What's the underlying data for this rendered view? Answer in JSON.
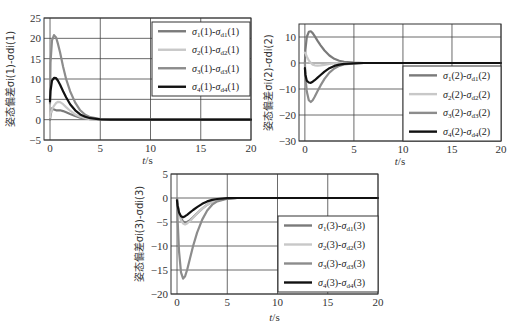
{
  "colors": {
    "s1": "#7a7a7a",
    "s2": "#c8c8c8",
    "s3": "#8c8c8c",
    "s4": "#111111",
    "grid": "#444444",
    "frame": "#333333"
  },
  "chart_data": [
    {
      "type": "line",
      "title": "",
      "xlabel": "t/s",
      "ylabel": "姿态偏差σi(1)-σdi(1)",
      "xlim": [
        -0.6,
        20
      ],
      "ylim": [
        -5,
        25
      ],
      "xticks": [
        0,
        5,
        10,
        15,
        20
      ],
      "yticks": [
        -5,
        0,
        5,
        10,
        15,
        20,
        25
      ],
      "grid": true,
      "legend_position": "upper right",
      "x": [
        0,
        0.05,
        0.2,
        0.4,
        0.6,
        0.8,
        1.0,
        1.3,
        1.6,
        2.0,
        2.5,
        3.0,
        3.5,
        4.0,
        5.0,
        6.0,
        8.0,
        20.0
      ],
      "series": [
        {
          "name": "σ1(1)-σd1(1)",
          "key": "s1",
          "values": [
            0,
            1,
            2.8,
            2.5,
            2.3,
            2.3,
            2.3,
            2.1,
            1.8,
            1.4,
            0.9,
            0.5,
            0.3,
            0.15,
            0.05,
            0,
            0,
            0
          ]
        },
        {
          "name": "σ2(1)-σd2(1)",
          "key": "s2",
          "values": [
            0.5,
            1.5,
            2.5,
            3.4,
            4.1,
            4.4,
            4.3,
            3.8,
            3.1,
            2.2,
            1.3,
            0.7,
            0.35,
            0.15,
            0.05,
            0,
            0,
            0
          ]
        },
        {
          "name": "σ3(1)-σd3(1)",
          "key": "s3",
          "values": [
            4,
            14,
            19.5,
            20.8,
            20.2,
            18.5,
            16.5,
            13,
            10,
            7,
            4.2,
            2.3,
            1.2,
            0.6,
            0.15,
            0.05,
            0,
            0
          ]
        },
        {
          "name": "σ4(1)-σd4(1)",
          "key": "s4",
          "values": [
            4.5,
            7,
            9.6,
            10.3,
            10.2,
            9.5,
            8.6,
            7.0,
            5.5,
            3.8,
            2.3,
            1.3,
            0.7,
            0.35,
            0.1,
            0,
            0,
            0
          ]
        }
      ]
    },
    {
      "type": "line",
      "title": "",
      "xlabel": "t/s",
      "ylabel": "姿态偏差σi(2)-σdi(2)",
      "xlim": [
        -0.6,
        20
      ],
      "ylim": [
        -30,
        15
      ],
      "xticks": [
        0,
        5,
        10,
        15,
        20
      ],
      "yticks": [
        -30,
        -20,
        -10,
        0,
        10
      ],
      "grid": true,
      "legend_position": "lower right",
      "x": [
        0,
        0.05,
        0.2,
        0.4,
        0.6,
        0.8,
        1.0,
        1.3,
        1.6,
        2.0,
        2.5,
        3.0,
        3.5,
        4.0,
        5.0,
        6.0,
        8.0,
        20.0
      ],
      "series": [
        {
          "name": "σ1(2)-σd1(2)",
          "key": "s1",
          "values": [
            0,
            5,
            10,
            12,
            12.2,
            11.5,
            10.3,
            8.5,
            6.8,
            4.8,
            2.9,
            1.6,
            0.9,
            0.45,
            0.1,
            0,
            0,
            0
          ]
        },
        {
          "name": "σ2(2)-σd2(2)",
          "key": "s2",
          "values": [
            4,
            3.8,
            2.5,
            1.0,
            0,
            -0.6,
            -0.9,
            -1.0,
            -0.9,
            -0.7,
            -0.4,
            -0.2,
            -0.1,
            0,
            0,
            0,
            0,
            0
          ]
        },
        {
          "name": "σ3(2)-σd3(2)",
          "key": "s3",
          "values": [
            0,
            -5,
            -11,
            -14.3,
            -15,
            -14.3,
            -13,
            -10.8,
            -8.6,
            -6.1,
            -3.7,
            -2.1,
            -1.1,
            -0.55,
            -0.15,
            0,
            0,
            0
          ]
        },
        {
          "name": "σ4(2)-σd4(2)",
          "key": "s4",
          "values": [
            -2,
            -4.5,
            -6.8,
            -7.5,
            -7.6,
            -7.2,
            -6.6,
            -5.6,
            -4.6,
            -3.3,
            -2.0,
            -1.1,
            -0.6,
            -0.3,
            -0.1,
            0,
            0,
            0
          ]
        }
      ]
    },
    {
      "type": "line",
      "title": "",
      "xlabel": "t/s",
      "ylabel": "姿态偏差σi(3)-σdi(3)",
      "xlim": [
        -0.6,
        20
      ],
      "ylim": [
        -20,
        5
      ],
      "xticks": [
        0,
        5,
        10,
        15,
        20
      ],
      "yticks": [
        -20,
        -15,
        -10,
        -5,
        0,
        5
      ],
      "grid": true,
      "legend_position": "lower right",
      "x": [
        0,
        0.05,
        0.2,
        0.4,
        0.6,
        0.8,
        1.0,
        1.3,
        1.6,
        2.0,
        2.5,
        3.0,
        3.5,
        4.0,
        5.0,
        6.0,
        8.0,
        20.0
      ],
      "series": [
        {
          "name": "σ1(3)-σd1(3)",
          "key": "s1",
          "values": [
            0,
            -1.2,
            -3,
            -4.2,
            -4.9,
            -5.1,
            -5.0,
            -4.6,
            -4.0,
            -3.2,
            -2.2,
            -1.4,
            -0.8,
            -0.45,
            -0.1,
            0,
            0,
            0
          ]
        },
        {
          "name": "σ2(3)-σd2(3)",
          "key": "s2",
          "values": [
            0,
            -1.5,
            -3.3,
            -4.6,
            -5.3,
            -5.5,
            -5.3,
            -4.8,
            -4.1,
            -3.2,
            -2.2,
            -1.4,
            -0.8,
            -0.45,
            -0.1,
            0,
            0,
            0
          ]
        },
        {
          "name": "σ3(3)-σd3(3)",
          "key": "s3",
          "values": [
            0,
            -4,
            -11,
            -15.5,
            -16.8,
            -16.3,
            -15,
            -12.5,
            -10,
            -7.2,
            -4.5,
            -2.6,
            -1.4,
            -0.7,
            -0.15,
            0,
            0,
            0
          ]
        },
        {
          "name": "σ4(3)-σd4(3)",
          "key": "s4",
          "values": [
            -0.5,
            -1.5,
            -3,
            -3.8,
            -4.0,
            -3.8,
            -3.5,
            -3.0,
            -2.5,
            -1.9,
            -1.2,
            -0.7,
            -0.4,
            -0.2,
            -0.05,
            0,
            0,
            0
          ]
        }
      ]
    }
  ],
  "layout": [
    {
      "box": [
        44,
        18,
        251,
        140
      ],
      "legend": [
        152,
        22,
        250,
        96
      ],
      "ylabel_x": 14,
      "xlabel_y": 164
    },
    {
      "box": [
        299,
        24,
        501,
        141
      ],
      "legend": [
        403,
        66,
        501,
        141
      ],
      "ylabel_x": 272,
      "xlabel_y": 165
    },
    {
      "box": [
        171,
        174,
        378,
        294
      ],
      "legend": [
        278,
        216,
        378,
        292
      ],
      "ylabel_x": 143,
      "xlabel_y": 321
    }
  ]
}
